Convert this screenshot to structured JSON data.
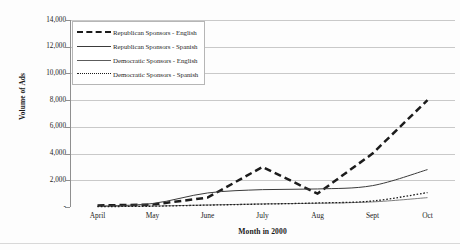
{
  "chart_data": {
    "type": "line",
    "title": "",
    "xlabel": "Month in 2000",
    "ylabel": "Volume of Ads",
    "categories": [
      "April",
      "May",
      "June",
      "July",
      "Aug",
      "Sept",
      "Oct"
    ],
    "ylim": [
      0,
      14000
    ],
    "ytick_labels": [
      "14,000",
      "12,000",
      "10,000",
      "8,000",
      "6,000",
      "4,000",
      "2,000",
      "-"
    ],
    "ytick_values": [
      14000,
      12000,
      10000,
      8000,
      6000,
      4000,
      2000,
      0
    ],
    "grid": "horizontal",
    "legend_position": "top-left",
    "series": [
      {
        "name": "Republican Sponsors - English",
        "style": "thick-dashed",
        "color": "#1c1c1c",
        "values": [
          120,
          180,
          700,
          3000,
          1000,
          4000,
          8000
        ]
      },
      {
        "name": "Republican Sponsors - Spanish",
        "style": "solid",
        "color": "#3b3b3b",
        "values": [
          60,
          260,
          1050,
          1300,
          1350,
          1600,
          2800
        ]
      },
      {
        "name": "Democratic Sponsors - English",
        "style": "thin-solid",
        "color": "#5c5c5c",
        "values": [
          40,
          70,
          150,
          230,
          280,
          380,
          700
        ]
      },
      {
        "name": "Democratic Sponsors - Spanish",
        "style": "dotted",
        "color": "#1c1c1c",
        "values": [
          30,
          60,
          140,
          220,
          300,
          450,
          1080
        ]
      }
    ]
  },
  "legend": {
    "items": [
      {
        "label": "Republican Sponsors - English"
      },
      {
        "label": "Republican Sponsors - Spanish"
      },
      {
        "label": "Democratic Sponsors - English"
      },
      {
        "label": "Democratic Sponsors - Spanish"
      }
    ]
  },
  "axes": {
    "y_title": "Volume of Ads",
    "x_title": "Month in 2000"
  },
  "colors": {
    "gridline": "#c9c9c9",
    "axis": "#8f8f8f",
    "text": "#242424",
    "background": "#ffffff"
  }
}
